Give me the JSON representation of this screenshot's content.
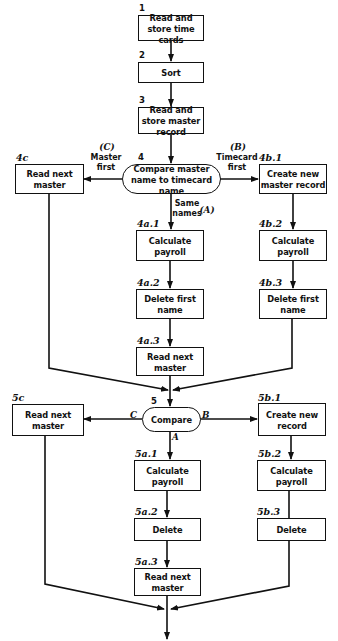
{
  "nodes": {
    "n1": {
      "id": "1",
      "text": "Read and store time cards"
    },
    "n2": {
      "id": "2",
      "text": "Sort"
    },
    "n3": {
      "id": "3",
      "text": "Read and store master record"
    },
    "n4": {
      "id": "4",
      "text": "Compare master name to timecard name"
    },
    "n4c": {
      "id": "4c",
      "text": "Read next master"
    },
    "n4b1": {
      "id": "4b.1",
      "text": "Create new master record"
    },
    "n4a1": {
      "id": "4a.1",
      "text": "Calculate payroll"
    },
    "n4b2": {
      "id": "4b.2",
      "text": "Calculate payroll"
    },
    "n4a2": {
      "id": "4a.2",
      "text": "Delete first name"
    },
    "n4b3": {
      "id": "4b.3",
      "text": "Delete first name"
    },
    "n4a3": {
      "id": "4a.3",
      "text": "Read next master"
    },
    "n5": {
      "id": "5",
      "text": "Compare"
    },
    "n5c": {
      "id": "5c",
      "text": "Read next master"
    },
    "n5b1": {
      "id": "5b.1",
      "text": "Create new record"
    },
    "n5a1": {
      "id": "5a.1",
      "text": "Calculate payroll"
    },
    "n5b2": {
      "id": "5b.2",
      "text": "Calculate payroll"
    },
    "n5a2": {
      "id": "5a.2",
      "text": "Delete"
    },
    "n5b3": {
      "id": "5b.3",
      "text": "Delete"
    },
    "n5a3": {
      "id": "5a.3",
      "text": "Read next master"
    }
  },
  "edge_labels": {
    "c4_letter": "(C)",
    "c4_text": "Master first",
    "b4_letter": "(B)",
    "b4_text": "Timecard first",
    "a4_text": "Same names",
    "a4_letter": "(A)",
    "c5": "C",
    "b5": "B",
    "a5": "A"
  }
}
